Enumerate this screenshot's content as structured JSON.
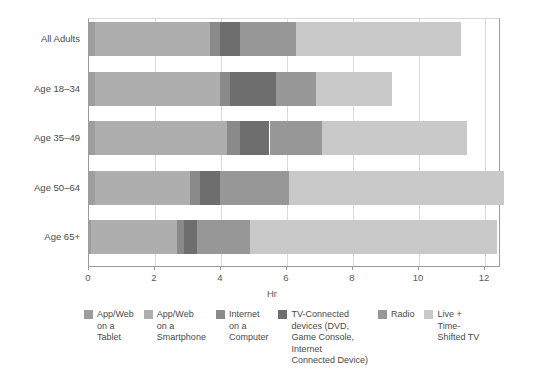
{
  "chart_data": {
    "type": "bar",
    "orientation": "horizontal",
    "stacked": true,
    "title": "",
    "xlabel": "Hr",
    "ylabel": "",
    "xlim": [
      0,
      12.5
    ],
    "xticks": [
      0,
      2,
      4,
      6,
      8,
      10,
      12
    ],
    "xtick_labels": [
      "0",
      "2",
      "4",
      "6",
      "8",
      "10",
      "12"
    ],
    "grid": true,
    "legend_position": "bottom",
    "categories": [
      "All Adults",
      "Age 18–34",
      "Age 35–49",
      "Age 50–64",
      "Age 65+"
    ],
    "series": [
      {
        "name": "App/Web on a Tablet",
        "legend_label": "App/Web\non a\nTablet",
        "color": "#9d9d9d",
        "values": [
          0.2,
          0.2,
          0.2,
          0.2,
          0.1
        ]
      },
      {
        "name": "App/Web on a Smartphone",
        "legend_label": "App/Web\non a\nSmartphone",
        "color": "#aeaeae",
        "values": [
          3.5,
          3.8,
          4.0,
          2.9,
          2.6
        ]
      },
      {
        "name": "Internet on a Computer",
        "legend_label": "Internet\non a\nComputer",
        "color": "#8a8a8a",
        "values": [
          0.3,
          0.3,
          0.4,
          0.3,
          0.2
        ]
      },
      {
        "name": "TV-Connected devices (DVD, Game Console, Internet Connected Device)",
        "legend_label": "TV-Connected\ndevices (DVD,\nGame Console,\nInternet\nConnected Device)",
        "color": "#6e6e6e",
        "values": [
          0.6,
          1.4,
          0.9,
          0.6,
          0.4
        ]
      },
      {
        "name": "Radio",
        "legend_label": "Radio",
        "color": "#979797",
        "values": [
          1.7,
          1.2,
          1.6,
          2.1,
          1.6
        ]
      },
      {
        "name": "Live + Time-Shifted TV",
        "legend_label": "Live +\nTime-\nShifted TV",
        "color": "#c9c9c9",
        "values": [
          5.0,
          2.3,
          4.4,
          6.5,
          7.5
        ]
      }
    ],
    "totals": [
      11.3,
      9.2,
      11.5,
      12.6,
      12.4
    ]
  },
  "axis": {
    "x_title": "Hr"
  }
}
